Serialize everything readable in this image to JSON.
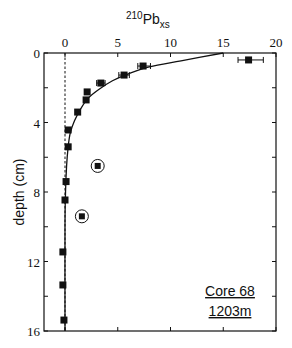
{
  "chart_data": {
    "type": "scatter",
    "title_parts": {
      "sup": "210",
      "base": "Pb",
      "sub": "xs"
    },
    "xlabel": "210Pb_xs",
    "ylabel": "depth (cm)",
    "xlim": [
      0,
      20
    ],
    "ylim": [
      16,
      0
    ],
    "x_axis_position": "top",
    "y_inverted": true,
    "x_ticks": [
      0,
      5,
      10,
      15,
      20
    ],
    "x_tick_labels": [
      "0",
      "5",
      "10",
      "15",
      "20"
    ],
    "y_ticks": [
      0,
      2,
      4,
      6,
      8,
      10,
      12,
      14,
      16
    ],
    "y_tick_labels": {
      "0": "0",
      "4": "4",
      "8": "8",
      "12": "12",
      "16": "16"
    },
    "grid": false,
    "zero_reference_line": {
      "x": 0,
      "style": "dashed"
    },
    "series": [
      {
        "name": "measured",
        "marker": "square",
        "points": [
          {
            "x": 17.4,
            "y": 0.4,
            "xerr": [
              16.4,
              18.8
            ]
          },
          {
            "x": 7.4,
            "y": 0.75,
            "xerr": [
              6.9,
              8.1
            ]
          },
          {
            "x": 5.6,
            "y": 1.27,
            "xerr": [
              5.1,
              6.1
            ]
          },
          {
            "x": 3.4,
            "y": 1.73,
            "xerr": [
              3.0,
              3.8
            ]
          },
          {
            "x": 2.1,
            "y": 2.24
          },
          {
            "x": 2.0,
            "y": 2.7
          },
          {
            "x": 1.2,
            "y": 3.4
          },
          {
            "x": 0.3,
            "y": 4.43
          },
          {
            "x": 0.3,
            "y": 5.4
          },
          {
            "x": 0.1,
            "y": 7.4
          },
          {
            "x": 0.0,
            "y": 8.46
          },
          {
            "x": -0.2,
            "y": 11.45
          },
          {
            "x": -0.2,
            "y": 13.35
          },
          {
            "x": -0.1,
            "y": 15.37
          }
        ]
      },
      {
        "name": "excluded (circled)",
        "marker": "circled-square",
        "points": [
          {
            "x": 3.1,
            "y": 6.5
          },
          {
            "x": 1.6,
            "y": 9.4
          }
        ]
      },
      {
        "name": "fit curve",
        "type": "line",
        "points": [
          {
            "x": 15.0,
            "y": 0.0
          },
          {
            "x": 11.0,
            "y": 0.45
          },
          {
            "x": 8.0,
            "y": 0.8
          },
          {
            "x": 6.0,
            "y": 1.2
          },
          {
            "x": 4.5,
            "y": 1.6
          },
          {
            "x": 3.2,
            "y": 2.1
          },
          {
            "x": 2.2,
            "y": 2.6
          },
          {
            "x": 1.5,
            "y": 3.2
          },
          {
            "x": 0.9,
            "y": 3.9
          },
          {
            "x": 0.5,
            "y": 4.6
          },
          {
            "x": 0.3,
            "y": 5.4
          },
          {
            "x": 0.15,
            "y": 6.5
          },
          {
            "x": 0.05,
            "y": 8.0
          },
          {
            "x": 0.0,
            "y": 10.0
          },
          {
            "x": 0.0,
            "y": 16.0
          }
        ]
      }
    ],
    "annotation": {
      "line1": "Core 68",
      "line2": "1203m",
      "position": "lower-right",
      "underlined": true
    }
  },
  "labels": {
    "title_sup": "210",
    "title_base": "Pb",
    "title_sub": "xs",
    "ylabel": "depth (cm)",
    "core": "Core 68",
    "depth": "1203m"
  }
}
